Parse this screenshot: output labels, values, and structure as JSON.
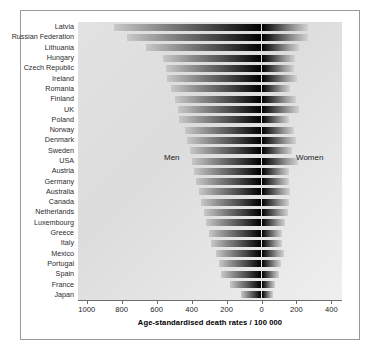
{
  "chart_data": {
    "type": "bar",
    "orientation": "horizontal-diverging",
    "title": "",
    "xlabel": "Age-standardised death rates / 100 000",
    "ylabel": "",
    "grid": false,
    "legend_position": "inside-plot",
    "axis": {
      "tick_labels": [
        "1000",
        "800",
        "600",
        "400",
        "200",
        "0",
        "200",
        "400"
      ],
      "tick_values": [
        -1000,
        -800,
        -600,
        -400,
        -200,
        0,
        200,
        400
      ],
      "left_limit": -1050,
      "right_limit": 430,
      "zero_position_label": "0"
    },
    "annotations": [
      {
        "text": "Men",
        "side": "left"
      },
      {
        "text": "Women",
        "side": "right"
      }
    ],
    "categories": [
      "Latvia",
      "Russian Federation",
      "Lithuania",
      "Hungary",
      "Czech Republic",
      "Ireland",
      "Romania",
      "Finland",
      "UK",
      "Poland",
      "Norway",
      "Denmark",
      "Sweden",
      "USA",
      "Austria",
      "Germany",
      "Australia",
      "Canada",
      "Netherlands",
      "Luxembourg",
      "Greece",
      "Italy",
      "Mexico",
      "Portugal",
      "Spain",
      "France",
      "Japan"
    ],
    "series": [
      {
        "name": "Men",
        "values": [
          845,
          770,
          660,
          565,
          545,
          540,
          520,
          495,
          480,
          470,
          440,
          425,
          410,
          400,
          385,
          375,
          360,
          345,
          330,
          315,
          300,
          290,
          260,
          245,
          230,
          180,
          115
        ]
      },
      {
        "name": "Women",
        "values": [
          265,
          265,
          215,
          190,
          185,
          205,
          165,
          195,
          215,
          160,
          185,
          195,
          175,
          210,
          160,
          155,
          165,
          160,
          150,
          135,
          120,
          120,
          130,
          110,
          100,
          80,
          65
        ]
      }
    ]
  }
}
